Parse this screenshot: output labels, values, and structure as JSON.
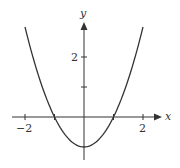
{
  "chart_data": {
    "type": "line",
    "title": "",
    "xlabel": "x",
    "ylabel": "y",
    "function": "y = x^2 - 1",
    "xlim": [
      -2.2,
      2.5
    ],
    "ylim": [
      -1.4,
      3.5
    ],
    "x_ticks": [
      -2,
      -1,
      1,
      2
    ],
    "x_tick_labels": [
      "-2",
      "",
      "",
      "2"
    ],
    "y_ticks": [
      1,
      2
    ],
    "y_tick_labels": [
      "",
      "2"
    ],
    "grid": false,
    "legend": null,
    "series": [
      {
        "name": "y = x^2 - 1",
        "x": [
          -2,
          -1.5,
          -1,
          -0.5,
          0,
          0.5,
          1,
          1.5,
          2
        ],
        "y": [
          3,
          1.25,
          0,
          -0.75,
          -1,
          -0.75,
          0,
          1.25,
          3
        ]
      }
    ],
    "annotations": {
      "x_intercepts": [
        -1,
        1
      ],
      "y_intercept": -1,
      "vertex": [
        0,
        -1
      ]
    }
  },
  "labels": {
    "x_axis": "x",
    "y_axis": "y",
    "x_tick_neg2": "−2",
    "x_tick_2": "2",
    "y_tick_2": "2"
  },
  "style": {
    "curve_color": "#333333",
    "axis_color": "#333333"
  }
}
